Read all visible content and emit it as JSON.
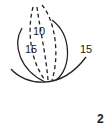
{
  "diagram": {
    "type": "petal-layer illustration",
    "labels": {
      "inner_dashed": "10",
      "left_solid": "15",
      "right_solid": "15"
    },
    "step_number": "2",
    "colors": {
      "stroke": "#222222",
      "background": "#ffffff"
    }
  }
}
